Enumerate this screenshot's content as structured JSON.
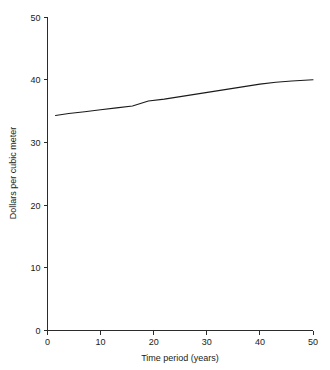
{
  "chart_data": {
    "type": "line",
    "title": "",
    "subtitle": "",
    "xlabel": "Time period (years)",
    "ylabel": "Dollars per cubic meter",
    "xlim": [
      0,
      50
    ],
    "ylim": [
      0,
      50
    ],
    "xticks": [
      0,
      10,
      20,
      30,
      40,
      50
    ],
    "yticks": [
      0,
      10,
      20,
      30,
      40,
      50
    ],
    "xtick_labels": [
      "0",
      "10",
      "20",
      "30",
      "40",
      "50"
    ],
    "ytick_labels": [
      "0",
      "10",
      "20",
      "30",
      "40",
      "50"
    ],
    "grid": false,
    "legend": null,
    "legend_position": "none",
    "line_color": "#1a1a1a",
    "background_color": "#ffffff",
    "series": [
      {
        "name": "Dollars per cubic meter",
        "x": [
          1.5,
          4,
          7,
          10,
          13,
          16,
          17.5,
          19,
          22,
          25,
          28,
          31,
          34,
          37,
          40,
          43,
          46,
          50
        ],
        "values": [
          34.3,
          34.6,
          34.9,
          35.2,
          35.5,
          35.8,
          36.2,
          36.6,
          36.9,
          37.3,
          37.7,
          38.1,
          38.5,
          38.9,
          39.3,
          39.6,
          39.8,
          40.0
        ]
      }
    ]
  },
  "axes": {
    "y_axis_label": "Dollars per cubic meter",
    "x_axis_label": "Time period (years)"
  }
}
